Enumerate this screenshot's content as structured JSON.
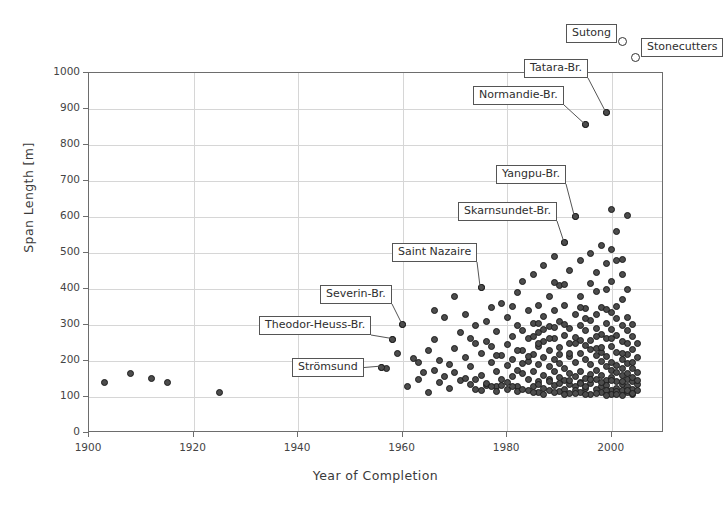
{
  "chart_data": {
    "type": "scatter",
    "title": "",
    "xlabel": "Year of Completion",
    "ylabel": "Span Length [m]",
    "xlim": [
      1900,
      2010
    ],
    "ylim": [
      0,
      1000
    ],
    "xticks": [
      1900,
      1920,
      1940,
      1960,
      1980,
      2000
    ],
    "yticks": [
      0,
      100,
      200,
      300,
      400,
      500,
      600,
      700,
      800,
      900,
      1000
    ],
    "grid": true,
    "legend": "none",
    "marker_style": "filled-circle",
    "offscale_marker_style": "hollow-circle",
    "note": "Cable-stayed bridge main span length versus year of completion. Sutong and Stonecutters plot above the 1000 m axis limit and are drawn as hollow circles outside the frame.",
    "annotations": [
      {
        "label": "Strömsund",
        "x": 1956,
        "y": 183
      },
      {
        "label": "Theodor-Heuss-Br.",
        "x": 1958,
        "y": 260
      },
      {
        "label": "Severin-Br.",
        "x": 1960,
        "y": 302
      },
      {
        "label": "Saint Nazaire",
        "x": 1975,
        "y": 404
      },
      {
        "label": "Skarnsundet-Br.",
        "x": 1991,
        "y": 530
      },
      {
        "label": "Yangpu-Br.",
        "x": 1993,
        "y": 602
      },
      {
        "label": "Normandie-Br.",
        "x": 1995,
        "y": 856
      },
      {
        "label": "Tatara-Br.",
        "x": 1999,
        "y": 890
      },
      {
        "label": "Sutong",
        "x": 2003,
        "y": 1088
      },
      {
        "label": "Stonecutters",
        "x": 2005,
        "y": 1018
      }
    ],
    "points": [
      [
        1903,
        141
      ],
      [
        1908,
        165
      ],
      [
        1912,
        152
      ],
      [
        1915,
        140
      ],
      [
        1925,
        113
      ],
      [
        1956,
        183
      ],
      [
        1957,
        178
      ],
      [
        1958,
        260
      ],
      [
        1960,
        302
      ],
      [
        1959,
        220
      ],
      [
        1961,
        130
      ],
      [
        1962,
        208
      ],
      [
        1963,
        148
      ],
      [
        1963,
        196
      ],
      [
        1964,
        168
      ],
      [
        1965,
        230
      ],
      [
        1965,
        113
      ],
      [
        1966,
        175
      ],
      [
        1966,
        260
      ],
      [
        1967,
        140
      ],
      [
        1967,
        202
      ],
      [
        1968,
        158
      ],
      [
        1968,
        320
      ],
      [
        1969,
        190
      ],
      [
        1969,
        124
      ],
      [
        1970,
        235
      ],
      [
        1970,
        168
      ],
      [
        1971,
        280
      ],
      [
        1971,
        145
      ],
      [
        1972,
        210
      ],
      [
        1972,
        330
      ],
      [
        1973,
        186
      ],
      [
        1973,
        262
      ],
      [
        1974,
        148
      ],
      [
        1974,
        300
      ],
      [
        1975,
        404
      ],
      [
        1975,
        220
      ],
      [
        1975,
        160
      ],
      [
        1976,
        255
      ],
      [
        1976,
        310
      ],
      [
        1976,
        132
      ],
      [
        1977,
        196
      ],
      [
        1977,
        350
      ],
      [
        1977,
        240
      ],
      [
        1978,
        170
      ],
      [
        1978,
        282
      ],
      [
        1978,
        128
      ],
      [
        1979,
        215
      ],
      [
        1979,
        360
      ],
      [
        1979,
        150
      ],
      [
        1980,
        245
      ],
      [
        1980,
        188
      ],
      [
        1980,
        320
      ],
      [
        1980,
        140
      ],
      [
        1981,
        268
      ],
      [
        1981,
        205
      ],
      [
        1981,
        156
      ],
      [
        1982,
        300
      ],
      [
        1982,
        175
      ],
      [
        1982,
        390
      ],
      [
        1982,
        130
      ],
      [
        1983,
        230
      ],
      [
        1983,
        285
      ],
      [
        1983,
        165
      ],
      [
        1983,
        420
      ],
      [
        1984,
        198
      ],
      [
        1984,
        340
      ],
      [
        1984,
        150
      ],
      [
        1984,
        262
      ],
      [
        1985,
        218
      ],
      [
        1985,
        305
      ],
      [
        1985,
        172
      ],
      [
        1985,
        440
      ],
      [
        1986,
        240
      ],
      [
        1986,
        190
      ],
      [
        1986,
        355
      ],
      [
        1986,
        142
      ],
      [
        1986,
        280
      ],
      [
        1987,
        210
      ],
      [
        1987,
        465
      ],
      [
        1987,
        160
      ],
      [
        1987,
        325
      ],
      [
        1987,
        255
      ],
      [
        1988,
        185
      ],
      [
        1988,
        380
      ],
      [
        1988,
        228
      ],
      [
        1988,
        148
      ],
      [
        1988,
        295
      ],
      [
        1989,
        205
      ],
      [
        1989,
        490
      ],
      [
        1989,
        170
      ],
      [
        1989,
        340
      ],
      [
        1989,
        262
      ],
      [
        1990,
        192
      ],
      [
        1990,
        410
      ],
      [
        1990,
        155
      ],
      [
        1990,
        238
      ],
      [
        1990,
        310
      ],
      [
        1991,
        530
      ],
      [
        1991,
        178
      ],
      [
        1991,
        272
      ],
      [
        1991,
        145
      ],
      [
        1991,
        355
      ],
      [
        1992,
        212
      ],
      [
        1992,
        452
      ],
      [
        1992,
        165
      ],
      [
        1992,
        290
      ],
      [
        1992,
        135
      ],
      [
        1992,
        248
      ],
      [
        1993,
        602
      ],
      [
        1993,
        196
      ],
      [
        1993,
        330
      ],
      [
        1993,
        158
      ],
      [
        1993,
        265
      ],
      [
        1993,
        128
      ],
      [
        1994,
        220
      ],
      [
        1994,
        478
      ],
      [
        1994,
        172
      ],
      [
        1994,
        300
      ],
      [
        1994,
        140
      ],
      [
        1994,
        380
      ],
      [
        1995,
        856
      ],
      [
        1995,
        205
      ],
      [
        1995,
        152
      ],
      [
        1995,
        285
      ],
      [
        1995,
        345
      ],
      [
        1995,
        125
      ],
      [
        1995,
        242
      ],
      [
        1996,
        190
      ],
      [
        1996,
        500
      ],
      [
        1996,
        162
      ],
      [
        1996,
        312
      ],
      [
        1996,
        138
      ],
      [
        1996,
        258
      ],
      [
        1996,
        415
      ],
      [
        1997,
        215
      ],
      [
        1997,
        175
      ],
      [
        1997,
        290
      ],
      [
        1997,
        148
      ],
      [
        1997,
        445
      ],
      [
        1997,
        235
      ],
      [
        1997,
        330
      ],
      [
        1998,
        198
      ],
      [
        1998,
        160
      ],
      [
        1998,
        275
      ],
      [
        1998,
        128
      ],
      [
        1998,
        520
      ],
      [
        1998,
        350
      ],
      [
        1998,
        225
      ],
      [
        1999,
        890
      ],
      [
        1999,
        185
      ],
      [
        1999,
        145
      ],
      [
        1999,
        262
      ],
      [
        1999,
        305
      ],
      [
        1999,
        470
      ],
      [
        1999,
        212
      ],
      [
        1999,
        132
      ],
      [
        2000,
        620
      ],
      [
        2000,
        175
      ],
      [
        2000,
        155
      ],
      [
        2000,
        288
      ],
      [
        2000,
        240
      ],
      [
        2000,
        118
      ],
      [
        2000,
        335
      ],
      [
        2000,
        195
      ],
      [
        2000,
        420
      ],
      [
        2000,
        510
      ],
      [
        2001,
        168
      ],
      [
        2001,
        142
      ],
      [
        2001,
        270
      ],
      [
        2001,
        225
      ],
      [
        2001,
        318
      ],
      [
        2001,
        560
      ],
      [
        2001,
        188
      ],
      [
        2001,
        125
      ],
      [
        2001,
        480
      ],
      [
        2002,
        160
      ],
      [
        2002,
        135
      ],
      [
        2002,
        255
      ],
      [
        2002,
        205
      ],
      [
        2002,
        300
      ],
      [
        2002,
        178
      ],
      [
        2002,
        118
      ],
      [
        2002,
        440
      ],
      [
        2002,
        370
      ],
      [
        2003,
        605
      ],
      [
        2003,
        150
      ],
      [
        2003,
        128
      ],
      [
        2003,
        248
      ],
      [
        2003,
        192
      ],
      [
        2003,
        285
      ],
      [
        2003,
        165
      ],
      [
        2003,
        112
      ],
      [
        2003,
        400
      ],
      [
        2003,
        218
      ],
      [
        2004,
        142
      ],
      [
        2004,
        122
      ],
      [
        2004,
        232
      ],
      [
        2004,
        180
      ],
      [
        2004,
        268
      ],
      [
        2004,
        155
      ],
      [
        2004,
        108
      ],
      [
        2004,
        195
      ],
      [
        2005,
        135
      ],
      [
        2005,
        118
      ],
      [
        2005,
        210
      ],
      [
        2005,
        168
      ],
      [
        2005,
        250
      ],
      [
        2005,
        145
      ],
      [
        1972,
        152
      ],
      [
        1973,
        135
      ],
      [
        1974,
        122
      ],
      [
        1975,
        118
      ],
      [
        1976,
        138
      ],
      [
        1977,
        128
      ],
      [
        1978,
        115
      ],
      [
        1979,
        132
      ],
      [
        1980,
        120
      ],
      [
        1981,
        128
      ],
      [
        1982,
        115
      ],
      [
        1983,
        122
      ],
      [
        1984,
        118
      ],
      [
        1985,
        128
      ],
      [
        1986,
        112
      ],
      [
        1987,
        125
      ],
      [
        1988,
        118
      ],
      [
        1989,
        132
      ],
      [
        1990,
        115
      ],
      [
        1991,
        122
      ],
      [
        1992,
        110
      ],
      [
        1993,
        118
      ],
      [
        1994,
        112
      ],
      [
        1995,
        130
      ],
      [
        1996,
        108
      ],
      [
        1997,
        120
      ],
      [
        1998,
        112
      ],
      [
        1999,
        118
      ],
      [
        2000,
        108
      ],
      [
        2001,
        115
      ],
      [
        2002,
        105
      ],
      [
        2003,
        118
      ],
      [
        2004,
        110
      ],
      [
        1985,
        112
      ],
      [
        1986,
        135
      ],
      [
        1987,
        108
      ],
      [
        1988,
        142
      ],
      [
        1989,
        112
      ],
      [
        1990,
        138
      ],
      [
        1991,
        108
      ],
      [
        1992,
        145
      ],
      [
        1993,
        110
      ],
      [
        1994,
        138
      ],
      [
        1995,
        108
      ],
      [
        1996,
        148
      ],
      [
        1997,
        110
      ],
      [
        1998,
        140
      ],
      [
        1999,
        105
      ],
      [
        2000,
        145
      ],
      [
        2001,
        108
      ],
      [
        2002,
        142
      ],
      [
        1966,
        340
      ],
      [
        1970,
        380
      ],
      [
        1974,
        250
      ],
      [
        1978,
        215
      ],
      [
        1982,
        228
      ],
      [
        1986,
        248
      ],
      [
        1990,
        218
      ],
      [
        1994,
        258
      ],
      [
        1998,
        238
      ],
      [
        2002,
        222
      ],
      [
        1981,
        352
      ],
      [
        1985,
        268
      ],
      [
        1989,
        292
      ],
      [
        1993,
        248
      ],
      [
        1997,
        268
      ],
      [
        2001,
        352
      ],
      [
        1984,
        212
      ],
      [
        1988,
        262
      ],
      [
        1992,
        222
      ],
      [
        1996,
        232
      ],
      [
        2000,
        262
      ],
      [
        2004,
        302
      ],
      [
        1987,
        288
      ],
      [
        1991,
        302
      ],
      [
        1995,
        318
      ],
      [
        1999,
        342
      ],
      [
        2003,
        322
      ],
      [
        1983,
        192
      ],
      [
        1991,
        412
      ],
      [
        1999,
        398
      ],
      [
        1994,
        348
      ],
      [
        1986,
        305
      ],
      [
        2002,
        482
      ],
      [
        1997,
        392
      ],
      [
        1989,
        418
      ]
    ]
  },
  "axis": {
    "y_tick_labels": [
      "0",
      "100",
      "200",
      "300",
      "400",
      "500",
      "600",
      "700",
      "800",
      "900",
      "1000"
    ],
    "x_tick_labels": [
      "1900",
      "1920",
      "1940",
      "1960",
      "1980",
      "2000"
    ]
  },
  "colors": {
    "marker_fill": "#4c4c4c",
    "marker_edge": "#1c1c1c",
    "grid": "#d6d6d6",
    "frame": "#6d6d6d",
    "text": "#3a3a3a",
    "background": "#ffffff"
  }
}
